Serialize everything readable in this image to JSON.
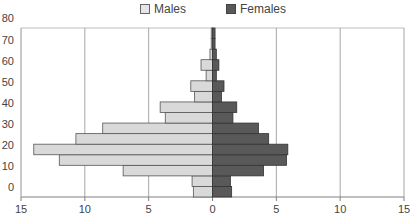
{
  "chart_data": {
    "type": "bar",
    "orientation": "horizontal",
    "subtype": "population-pyramid",
    "title": "",
    "xlabel": "",
    "ylabel": "",
    "categories": [
      "0-5",
      "5-10",
      "10-15",
      "15-20",
      "20-25",
      "25-30",
      "30-35",
      "35-40",
      "40-45",
      "45-50",
      "50-55",
      "55-60",
      "60-65",
      "65-70",
      "70-75",
      "75-80"
    ],
    "series": [
      {
        "name": "Males",
        "color": "#d9d9d9",
        "values": [
          1.5,
          1.6,
          7.0,
          12.0,
          14.0,
          10.7,
          8.6,
          3.7,
          4.1,
          1.4,
          1.7,
          0.5,
          0.9,
          0.2,
          0.1,
          0.1
        ]
      },
      {
        "name": "Females",
        "color": "#595959",
        "values": [
          1.5,
          1.4,
          4.0,
          5.8,
          5.9,
          4.4,
          3.6,
          1.6,
          1.9,
          0.7,
          0.9,
          0.3,
          0.5,
          0.3,
          0.2,
          0.2
        ]
      }
    ],
    "x_ticks": [
      "15",
      "10",
      "5",
      "0",
      "5",
      "10",
      "15"
    ],
    "y_ticks": [
      "0",
      "10",
      "20",
      "30",
      "40",
      "50",
      "60",
      "70",
      "80"
    ],
    "xlim": [
      -15,
      15
    ],
    "ylim": [
      0,
      80
    ],
    "grid": {
      "vertical": true,
      "horizontal": false
    },
    "legend_position": "top"
  },
  "legend": {
    "males_label": "Males",
    "females_label": "Females"
  }
}
